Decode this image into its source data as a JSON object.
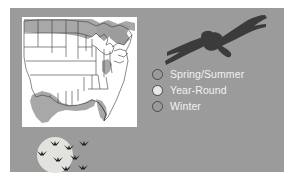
{
  "poster": {
    "background_color": "#9b9b9b",
    "outer_color": "#ffffff",
    "text_color": "#f2f2f2",
    "outline_color": "#4a4a4a"
  },
  "map": {
    "name": "united-states-range-map",
    "background_color": "#ffffff",
    "range_fill_color": "#a6a6a6",
    "border_color": "#3a3a3a",
    "regions": [
      {
        "name": "northern-border-breeding-range",
        "season": "Spring/Summer"
      },
      {
        "name": "gulf-coast-wintering-range",
        "season": "Winter"
      },
      {
        "name": "mid-atlantic-wintering-range",
        "season": "Winter"
      },
      {
        "name": "interior-year-round-range",
        "season": "Year-Round"
      }
    ]
  },
  "raptor": {
    "name": "soaring-raptor-silhouette",
    "color": "#3b3b3b"
  },
  "legend": {
    "items": [
      {
        "label": "Spring/Summer",
        "swatch_color": "#9b9b9b",
        "swatch_name": "swatch-spring-summer"
      },
      {
        "label": "Year-Round",
        "swatch_color": "#e8e8e4",
        "swatch_name": "swatch-year-round"
      },
      {
        "label": "Winter",
        "swatch_color": "#9b9b9b",
        "swatch_name": "swatch-winter"
      }
    ]
  },
  "migration": {
    "name": "geese-flying-past-moon",
    "moon_color": "#e2e2de",
    "bird_color": "#1f1f1f",
    "bird_count": 7
  }
}
